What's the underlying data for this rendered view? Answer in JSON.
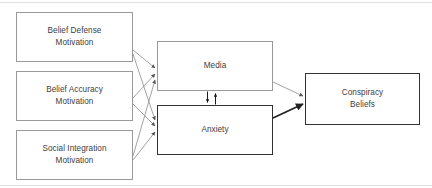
{
  "diagram": {
    "background_color": "#ffffff",
    "thin_stroke_color": "#999999",
    "thick_stroke_color": "#333333",
    "text_color": "#404040",
    "nodes": {
      "belief_defense": {
        "label": "Belief Defense\nMotivation",
        "line1": "Belief Defense",
        "line2": "Motivation"
      },
      "belief_accuracy": {
        "label": "Belief Accuracy\nMotivation",
        "line1": "Belief Accuracy",
        "line2": "Motivation"
      },
      "social_integration": {
        "label": "Social Integration\nMotivation",
        "line1": "Social Integration",
        "line2": "Motivation"
      },
      "media": {
        "label": "Media"
      },
      "anxiety": {
        "label": "Anxiety"
      },
      "conspiracy_beliefs": {
        "label": "Conspiracy\nBeliefs",
        "line1": "Conspiracy",
        "line2": "Beliefs"
      }
    },
    "edges": [
      {
        "name": "belief-defense-to-media",
        "from": "belief_defense",
        "to": "media",
        "style": "thin",
        "arrow": "single"
      },
      {
        "name": "belief-defense-to-anxiety",
        "from": "belief_defense",
        "to": "anxiety",
        "style": "thin",
        "arrow": "single"
      },
      {
        "name": "belief-accuracy-to-media",
        "from": "belief_accuracy",
        "to": "media",
        "style": "thin",
        "arrow": "single"
      },
      {
        "name": "belief-accuracy-to-anxiety",
        "from": "belief_accuracy",
        "to": "anxiety",
        "style": "thin",
        "arrow": "single"
      },
      {
        "name": "social-integration-to-media",
        "from": "social_integration",
        "to": "media",
        "style": "thin",
        "arrow": "single"
      },
      {
        "name": "social-integration-to-anxiety",
        "from": "social_integration",
        "to": "anxiety",
        "style": "thin",
        "arrow": "single"
      },
      {
        "name": "media-to-anxiety",
        "from": "media",
        "to": "anxiety",
        "style": "thick",
        "arrow": "single"
      },
      {
        "name": "anxiety-to-media",
        "from": "anxiety",
        "to": "media",
        "style": "thick",
        "arrow": "single"
      },
      {
        "name": "media-to-conspiracy-beliefs",
        "from": "media",
        "to": "conspiracy_beliefs",
        "style": "thin",
        "arrow": "single"
      },
      {
        "name": "anxiety-to-conspiracy-beliefs",
        "from": "anxiety",
        "to": "conspiracy_beliefs",
        "style": "thick",
        "arrow": "single"
      }
    ]
  }
}
